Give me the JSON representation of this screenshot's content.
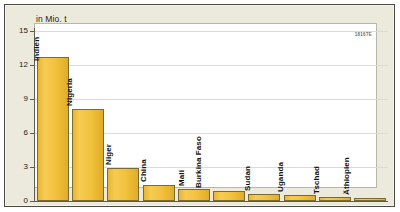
{
  "chart_data": {
    "type": "bar",
    "title": "",
    "subtitle": "",
    "unit_caption": "in Mio. t",
    "xlabel": "",
    "ylabel": "in Mio. t",
    "ylim": [
      0,
      15
    ],
    "yticks": [
      0,
      3,
      6,
      9,
      12,
      15
    ],
    "ytick_labels": [
      "0",
      "3",
      "6",
      "9",
      "12",
      "15"
    ],
    "grid": true,
    "legend": false,
    "legend_position": "none",
    "categories": [
      "Indien",
      "Nigeria",
      "Niger",
      "China",
      "Mali",
      "Burkina Faso",
      "Sudan",
      "Uganda",
      "Tschad",
      "Äthiopien"
    ],
    "values": [
      12.7,
      8.1,
      2.9,
      1.4,
      1.1,
      0.9,
      0.65,
      0.55,
      0.35,
      0.25
    ],
    "bars": [
      {
        "label": "Indien",
        "value": 12.7,
        "label_inside": true
      },
      {
        "label": "Nigeria",
        "value": 8.1,
        "label_inside": false
      },
      {
        "label": "Niger",
        "value": 2.9,
        "label_inside": false
      },
      {
        "label": "China",
        "value": 1.4,
        "label_inside": false
      },
      {
        "label": "Mali",
        "value": 1.1,
        "label_inside": false
      },
      {
        "label": "Burkina Faso",
        "value": 0.9,
        "label_inside": false
      },
      {
        "label": "Sudan",
        "value": 0.65,
        "label_inside": false
      },
      {
        "label": "Uganda",
        "value": 0.55,
        "label_inside": false
      },
      {
        "label": "Tschad",
        "value": 0.35,
        "label_inside": false
      },
      {
        "label": "Äthiopien",
        "value": 0.25,
        "label_inside": false
      }
    ],
    "colors": {
      "bar_fill": "#f2c13c",
      "bar_fill_light": "#f6cb54",
      "bar_fill_dark": "#e0ad28",
      "bar_border": "#7a6a33",
      "plot_background": "#ffffff",
      "poster_background": "#eceadd",
      "gridline": "#dddcd4",
      "axis": "#5d5b52",
      "frame_border": "#4a4a44",
      "text": "#1b1b1b"
    }
  },
  "footer": {
    "id_code": "18167E"
  }
}
